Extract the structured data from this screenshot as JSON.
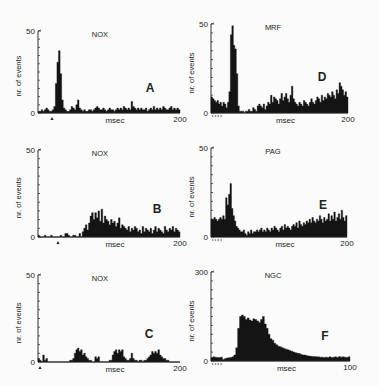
{
  "figure": {
    "ylabel": "nr. of events",
    "xlabel": "msec"
  },
  "chart_data": [
    {
      "type": "bar",
      "panel": "A",
      "title": "NOX",
      "xlabel": "msec",
      "ylabel": "nr. of events",
      "xlim": [
        0,
        200
      ],
      "ylim": [
        0,
        50
      ],
      "x_tick_labels": [
        "200"
      ],
      "y_tick_labels": [
        "0",
        "50"
      ],
      "stimulus_marker": "triangle",
      "values": [
        1,
        1,
        2,
        1,
        2,
        3,
        2,
        1,
        1,
        2,
        4,
        18,
        31,
        38,
        24,
        8,
        3,
        2,
        1,
        1,
        2,
        4,
        3,
        2,
        5,
        8,
        3,
        2,
        1,
        2,
        1,
        1,
        2,
        2,
        1,
        2,
        3,
        4,
        3,
        2,
        2,
        3,
        2,
        1,
        2,
        3,
        2,
        2,
        1,
        2,
        3,
        2,
        3,
        2,
        4,
        3,
        2,
        3,
        2,
        7,
        4,
        3,
        2,
        3,
        2,
        3,
        2,
        2,
        3,
        1,
        2,
        3,
        2,
        4,
        2,
        3,
        2,
        3,
        2,
        4,
        3,
        2,
        2,
        3,
        4,
        2,
        3,
        2,
        3,
        2
      ]
    },
    {
      "type": "bar",
      "panel": "B",
      "title": "NOX",
      "xlabel": "msec",
      "ylabel": "nr. of events",
      "xlim": [
        0,
        200
      ],
      "ylim": [
        0,
        50
      ],
      "x_tick_labels": [
        "200"
      ],
      "y_tick_labels": [
        "0",
        "50"
      ],
      "stimulus_marker": "triangle",
      "values": [
        1,
        0,
        0,
        0,
        1,
        0,
        0,
        0,
        1,
        0,
        0,
        0,
        0,
        0,
        1,
        0,
        0,
        2,
        2,
        1,
        0,
        0,
        1,
        1,
        0,
        0,
        2,
        0,
        3,
        5,
        7,
        4,
        8,
        12,
        14,
        10,
        14,
        11,
        15,
        9,
        16,
        8,
        12,
        10,
        9,
        7,
        10,
        8,
        9,
        6,
        8,
        11,
        5,
        7,
        6,
        5,
        4,
        6,
        3,
        5,
        4,
        6,
        5,
        3,
        4,
        2,
        6,
        3,
        5,
        4,
        3,
        5,
        2,
        4,
        6,
        3,
        5,
        4,
        3,
        2,
        6,
        4,
        3,
        5,
        4,
        6,
        3,
        5,
        4,
        3
      ]
    },
    {
      "type": "bar",
      "panel": "C",
      "title": "NOX",
      "xlabel": "msec",
      "ylabel": "nr. of events",
      "xlim": [
        0,
        200
      ],
      "ylim": [
        0,
        50
      ],
      "x_tick_labels": [
        "200"
      ],
      "y_tick_labels": [
        "0",
        "50"
      ],
      "stimulus_marker": "triangle",
      "values": [
        2,
        1,
        0,
        4,
        1,
        2,
        0,
        0,
        0,
        0,
        0,
        0,
        0,
        0,
        0,
        0,
        0,
        0,
        0,
        0,
        1,
        1,
        2,
        5,
        7,
        8,
        6,
        7,
        4,
        5,
        3,
        2,
        1,
        1,
        0,
        0,
        3,
        2,
        3,
        0,
        0,
        0,
        0,
        0,
        0,
        1,
        1,
        4,
        6,
        7,
        5,
        7,
        6,
        7,
        3,
        2,
        1,
        1,
        2,
        5,
        2,
        1,
        1,
        0,
        1,
        1,
        0,
        1,
        1,
        2,
        3,
        4,
        6,
        5,
        6,
        5,
        7,
        4,
        3,
        2,
        2,
        1,
        1,
        0,
        0,
        0,
        0,
        0,
        0,
        0
      ]
    },
    {
      "type": "bar",
      "panel": "D",
      "title": "MRF",
      "xlabel": "msec",
      "ylabel": "nr. of events",
      "xlim": [
        0,
        200
      ],
      "ylim": [
        0,
        50
      ],
      "x_tick_labels": [
        "200"
      ],
      "y_tick_labels": [
        "0",
        "50"
      ],
      "stimulus_marker": "dotted",
      "values": [
        9,
        8,
        7,
        6,
        7,
        5,
        6,
        4,
        6,
        5,
        3,
        6,
        12,
        44,
        49,
        38,
        36,
        22,
        4,
        1,
        1,
        1,
        0,
        1,
        1,
        2,
        1,
        1,
        3,
        2,
        1,
        4,
        5,
        4,
        3,
        5,
        2,
        4,
        6,
        5,
        10,
        6,
        9,
        8,
        7,
        5,
        8,
        11,
        7,
        9,
        11,
        8,
        6,
        10,
        15,
        8,
        6,
        5,
        4,
        6,
        5,
        4,
        7,
        6,
        5,
        4,
        6,
        8,
        6,
        5,
        7,
        9,
        8,
        6,
        10,
        7,
        9,
        8,
        11,
        10,
        9,
        12,
        10,
        8,
        13,
        11,
        17,
        15,
        13,
        10,
        12,
        9
      ]
    },
    {
      "type": "bar",
      "panel": "E",
      "title": "PAG",
      "xlabel": "msec",
      "ylabel": "nr. of events",
      "xlim": [
        0,
        200
      ],
      "ylim": [
        0,
        50
      ],
      "x_tick_labels": [
        "200"
      ],
      "y_tick_labels": [
        "0",
        "50"
      ],
      "stimulus_marker": "dotted",
      "values": [
        10,
        10,
        11,
        10,
        9,
        10,
        11,
        10,
        12,
        10,
        22,
        18,
        24,
        30,
        16,
        12,
        9,
        6,
        5,
        4,
        3,
        3,
        4,
        2,
        1,
        3,
        2,
        4,
        2,
        3,
        3,
        4,
        3,
        4,
        5,
        3,
        4,
        3,
        5,
        4,
        3,
        5,
        4,
        6,
        5,
        4,
        3,
        5,
        6,
        4,
        7,
        5,
        6,
        5,
        4,
        6,
        7,
        6,
        8,
        5,
        9,
        7,
        6,
        8,
        7,
        9,
        8,
        10,
        8,
        11,
        9,
        8,
        10,
        9,
        12,
        10,
        8,
        11,
        9,
        10,
        13,
        9,
        12,
        10,
        14,
        9,
        11,
        13,
        10,
        15,
        11,
        9,
        12
      ]
    },
    {
      "type": "bar",
      "panel": "F",
      "title": "NGC",
      "xlabel": "msec",
      "ylabel": "nr. of events",
      "xlim": [
        0,
        100
      ],
      "ylim": [
        0,
        300
      ],
      "x_tick_labels": [
        "100"
      ],
      "y_tick_labels": [
        "0",
        "300"
      ],
      "stimulus_marker": "dotted",
      "values": [
        12,
        14,
        13,
        12,
        12,
        13,
        5,
        8,
        10,
        11,
        12,
        14,
        20,
        45,
        110,
        150,
        155,
        150,
        140,
        145,
        138,
        135,
        142,
        140,
        135,
        130,
        140,
        150,
        125,
        110,
        90,
        75,
        70,
        60,
        55,
        50,
        48,
        45,
        42,
        40,
        38,
        35,
        33,
        30,
        28,
        26,
        25,
        22,
        20,
        20,
        18,
        17,
        16,
        15,
        15,
        14,
        14,
        13,
        13,
        12,
        13,
        12,
        14,
        12,
        13,
        14,
        12,
        15,
        13,
        14,
        13,
        12,
        14
      ]
    }
  ]
}
